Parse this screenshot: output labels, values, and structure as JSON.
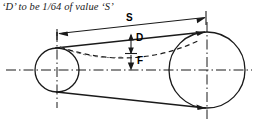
{
  "diagram": {
    "caption": "‘D’ to be 1/64 of value ‘S’",
    "labels": {
      "span": "S",
      "deflection": "D",
      "force": "F"
    },
    "colors": {
      "line": "#1a1a1a",
      "background": "#ffffff",
      "text": "#000000"
    },
    "geometry": {
      "small_pulley": {
        "cx": 57,
        "cy": 70,
        "r": 22
      },
      "large_pulley": {
        "cx": 207,
        "cy": 70,
        "r": 38
      }
    },
    "icon_names": {
      "small_pulley": "small-pulley-circle-icon",
      "large_pulley": "large-pulley-circle-icon",
      "belt_top": "belt-top-tangent-line",
      "belt_bottom": "belt-bottom-tangent-line",
      "belt_deflected": "belt-deflected-dashed-curve",
      "span_dimension": "span-dimension-arrow",
      "deflection_dimension": "deflection-dimension-arrow",
      "force_arrow": "force-direction-arrow"
    }
  }
}
